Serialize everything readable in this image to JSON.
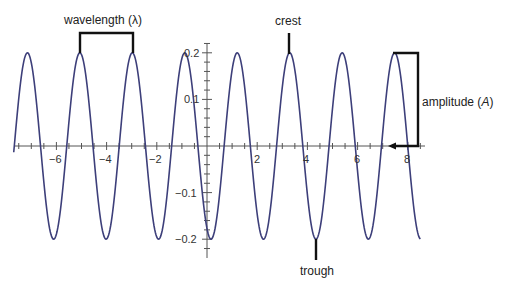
{
  "diagram": {
    "annotations": {
      "wavelength": "wavelength (λ)",
      "crest": "crest",
      "trough": "trough",
      "amplitude_prefix": "amplitude (",
      "amplitude_symbol": "A",
      "amplitude_suffix": ")"
    },
    "x_ticks": [
      {
        "label": "−6",
        "value": -6
      },
      {
        "label": "−4",
        "value": -4
      },
      {
        "label": "−2",
        "value": -2
      },
      {
        "label": "2",
        "value": 2
      },
      {
        "label": "4",
        "value": 4
      },
      {
        "label": "6",
        "value": 6
      },
      {
        "label": "8",
        "value": 8
      }
    ],
    "y_ticks": [
      {
        "label": "0.2",
        "value": 0.2
      },
      {
        "label": "0.1",
        "value": 0.1
      },
      {
        "label": "−0.1",
        "value": -0.1
      },
      {
        "label": "−0.2",
        "value": -0.2
      }
    ],
    "curve": {
      "amplitude": 0.2,
      "period": 2.09,
      "x_range": [
        -7.7,
        8.5
      ],
      "color": "#3d3f7a"
    },
    "annotation_color": "#111111"
  }
}
